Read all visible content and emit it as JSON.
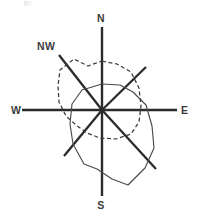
{
  "figure": {
    "title": "",
    "background_color": "#ffffff",
    "width": 199,
    "height": 221
  },
  "axis_labels": {
    "north": "N",
    "south": "S",
    "east": "E",
    "west": "W",
    "northwest": "NW"
  },
  "colors": {
    "axis": "#2b2b2b",
    "solid_series": "#4a4a4a",
    "dashed_series": "#3a3a3a",
    "label": "#3b3b3b"
  },
  "chart_data": {
    "type": "line",
    "subtype": "polar-radar-rose",
    "title": "",
    "subtitle": "",
    "xlabel": "",
    "ylabel": "",
    "grid": false,
    "legend_position": "none",
    "center": {
      "x": 102,
      "y": 110
    },
    "axes": {
      "labels": [
        "N",
        "NE",
        "E",
        "SE",
        "S",
        "SW",
        "W",
        "NW"
      ],
      "labeled_visible": [
        "N",
        "E",
        "S",
        "W",
        "NW"
      ],
      "angles_deg": [
        0,
        45,
        90,
        135,
        180,
        225,
        270,
        315
      ],
      "spokes": [
        {
          "name": "N",
          "x1": 102,
          "y1": 110,
          "x2": 102,
          "y2": 27
        },
        {
          "name": "S",
          "x1": 102,
          "y1": 110,
          "x2": 102,
          "y2": 196
        },
        {
          "name": "E",
          "x1": 102,
          "y1": 110,
          "x2": 177,
          "y2": 110
        },
        {
          "name": "W",
          "x1": 102,
          "y1": 110,
          "x2": 22,
          "y2": 110
        },
        {
          "name": "NW",
          "x1": 102,
          "y1": 110,
          "x2": 59,
          "y2": 55
        },
        {
          "name": "SE",
          "x1": 102,
          "y1": 110,
          "x2": 156,
          "y2": 169
        },
        {
          "name": "NE",
          "x1": 102,
          "y1": 110,
          "x2": 146,
          "y2": 67
        },
        {
          "name": "SW",
          "x1": 102,
          "y1": 110,
          "x2": 64,
          "y2": 156
        }
      ]
    },
    "label_positions": {
      "N": {
        "x": 101,
        "y": 22
      },
      "S": {
        "x": 101,
        "y": 209
      },
      "E": {
        "x": 181,
        "y": 114
      },
      "W": {
        "x": 11,
        "y": 114
      },
      "NW": {
        "x": 37,
        "y": 50
      }
    },
    "series": [
      {
        "name": "solid-outline",
        "style": "solid",
        "color": "#4a4a4a",
        "closed": true,
        "points": [
          {
            "x": 102,
            "y": 84
          },
          {
            "x": 120,
            "y": 85
          },
          {
            "x": 133,
            "y": 92
          },
          {
            "x": 146,
            "y": 105
          },
          {
            "x": 152,
            "y": 126
          },
          {
            "x": 154,
            "y": 148
          },
          {
            "x": 145,
            "y": 168
          },
          {
            "x": 128,
            "y": 185
          },
          {
            "x": 112,
            "y": 179
          },
          {
            "x": 97,
            "y": 169
          },
          {
            "x": 84,
            "y": 164
          },
          {
            "x": 73,
            "y": 144
          },
          {
            "x": 70,
            "y": 124
          },
          {
            "x": 72,
            "y": 104
          },
          {
            "x": 82,
            "y": 90
          }
        ]
      },
      {
        "name": "dashed-outline",
        "style": "dashed",
        "color": "#3a3a3a",
        "closed": true,
        "points": [
          {
            "x": 102,
            "y": 61
          },
          {
            "x": 117,
            "y": 64
          },
          {
            "x": 131,
            "y": 72
          },
          {
            "x": 139,
            "y": 88
          },
          {
            "x": 141,
            "y": 106
          },
          {
            "x": 139,
            "y": 122
          },
          {
            "x": 131,
            "y": 134
          },
          {
            "x": 116,
            "y": 139
          },
          {
            "x": 100,
            "y": 138
          },
          {
            "x": 87,
            "y": 133
          },
          {
            "x": 76,
            "y": 125
          },
          {
            "x": 66,
            "y": 116
          },
          {
            "x": 59,
            "y": 102
          },
          {
            "x": 58,
            "y": 86
          },
          {
            "x": 60,
            "y": 70
          },
          {
            "x": 74,
            "y": 59
          },
          {
            "x": 88,
            "y": 66
          }
        ]
      }
    ]
  }
}
